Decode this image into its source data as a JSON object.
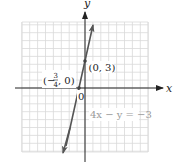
{
  "chart_data": {
    "type": "line",
    "title": "",
    "xlabel": "x",
    "ylabel": "y",
    "equation": "4x − y = −3",
    "slope": 4,
    "y_intercept": 3,
    "series": [
      {
        "name": "4x − y = −3",
        "x": [
          -2,
          1
        ],
        "values": [
          -5,
          7
        ]
      }
    ],
    "points": [
      {
        "x": -0.75,
        "y": 0,
        "label": "(−3/4, 0)"
      },
      {
        "x": 0,
        "y": 3,
        "label": "(0, 3)"
      }
    ],
    "origin_label": "0",
    "grid": true,
    "xlim": [
      -7,
      7
    ],
    "ylim": [
      -7,
      7
    ]
  },
  "labels": {
    "x_axis": "x",
    "y_axis": "y",
    "origin": "0",
    "point_a_prefix": "(−",
    "point_a_num": "3",
    "point_a_den": "4",
    "point_a_suffix": ", 0)",
    "point_b": "(0, 3)",
    "equation": "4x − y = −3"
  },
  "colors": {
    "line": "#555555",
    "grid": "#d8d8d8",
    "axis": "#222222",
    "equation": "#9a9a9a"
  }
}
